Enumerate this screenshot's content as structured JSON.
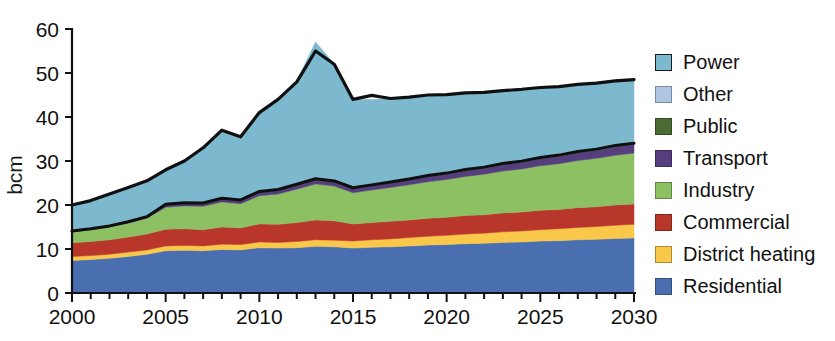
{
  "chart_data": {
    "type": "area",
    "stacked": true,
    "title": "",
    "subtitle": "",
    "xlabel": "",
    "ylabel": "bcm",
    "xlim": [
      2000,
      2030
    ],
    "ylim": [
      0,
      60
    ],
    "ytick_values": [
      0,
      10,
      20,
      30,
      40,
      50,
      60
    ],
    "ytick_labels": [
      "0",
      "10",
      "20",
      "30",
      "40",
      "50",
      "60"
    ],
    "xtick_values": [
      2000,
      2005,
      2010,
      2015,
      2020,
      2025,
      2030
    ],
    "xtick_labels": [
      "2000",
      "2005",
      "2010",
      "2015",
      "2020",
      "2025",
      "2030"
    ],
    "x_minor_tick_interval": 1,
    "grid": false,
    "legend_position": "right",
    "x": [
      2000,
      2001,
      2002,
      2003,
      2004,
      2005,
      2006,
      2007,
      2008,
      2009,
      2010,
      2011,
      2012,
      2013,
      2014,
      2015,
      2016,
      2017,
      2018,
      2019,
      2020,
      2021,
      2022,
      2023,
      2024,
      2025,
      2026,
      2027,
      2028,
      2029,
      2030
    ],
    "stack_order_bottom_to_top": [
      "Residential",
      "District heating",
      "Commercial",
      "Industry",
      "Transport",
      "Public",
      "Other",
      "Power"
    ],
    "series": [
      {
        "name": "Residential",
        "color": "#4A6FB0",
        "values": [
          7.4,
          7.6,
          7.9,
          8.3,
          8.8,
          9.6,
          9.7,
          9.6,
          9.9,
          9.8,
          10.3,
          10.2,
          10.3,
          10.6,
          10.5,
          10.2,
          10.4,
          10.5,
          10.7,
          10.9,
          11.0,
          11.2,
          11.3,
          11.5,
          11.6,
          11.8,
          11.9,
          12.1,
          12.2,
          12.4,
          12.5
        ]
      },
      {
        "name": "District heating",
        "color": "#F9C84A",
        "values": [
          0.9,
          0.9,
          0.9,
          1.0,
          1.0,
          1.1,
          1.1,
          1.1,
          1.2,
          1.2,
          1.3,
          1.3,
          1.4,
          1.5,
          1.5,
          1.6,
          1.7,
          1.8,
          1.9,
          2.0,
          2.1,
          2.2,
          2.3,
          2.4,
          2.5,
          2.6,
          2.7,
          2.8,
          2.9,
          3.0,
          3.1
        ]
      },
      {
        "name": "Commercial",
        "color": "#B8372A",
        "values": [
          3.1,
          3.2,
          3.3,
          3.4,
          3.6,
          3.8,
          3.8,
          3.7,
          3.9,
          3.8,
          4.1,
          4.1,
          4.3,
          4.5,
          4.4,
          3.9,
          3.9,
          4.0,
          4.0,
          4.1,
          4.1,
          4.2,
          4.2,
          4.3,
          4.3,
          4.4,
          4.4,
          4.5,
          4.5,
          4.6,
          4.6
        ]
      },
      {
        "name": "Industry",
        "color": "#8CC063",
        "values": [
          2.5,
          2.7,
          2.9,
          3.2,
          3.6,
          5.0,
          5.2,
          5.3,
          5.7,
          5.5,
          6.4,
          6.9,
          7.6,
          8.2,
          7.9,
          7.1,
          7.4,
          7.7,
          8.0,
          8.3,
          8.6,
          8.9,
          9.2,
          9.5,
          9.8,
          10.1,
          10.4,
          10.7,
          11.0,
          11.3,
          11.6
        ]
      },
      {
        "name": "Transport",
        "color": "#553E7E",
        "values": [
          0.1,
          0.1,
          0.15,
          0.2,
          0.25,
          0.5,
          0.55,
          0.6,
          0.7,
          0.7,
          0.8,
          0.85,
          0.9,
          0.95,
          0.95,
          0.9,
          0.95,
          1.0,
          1.1,
          1.15,
          1.2,
          1.3,
          1.35,
          1.45,
          1.5,
          1.6,
          1.65,
          1.75,
          1.8,
          1.9,
          1.95
        ]
      },
      {
        "name": "Public",
        "color": "#4A6B33",
        "values": [
          0.05,
          0.05,
          0.05,
          0.05,
          0.05,
          0.1,
          0.1,
          0.1,
          0.1,
          0.1,
          0.12,
          0.12,
          0.14,
          0.15,
          0.15,
          0.15,
          0.15,
          0.16,
          0.16,
          0.17,
          0.17,
          0.18,
          0.18,
          0.19,
          0.19,
          0.2,
          0.2,
          0.21,
          0.21,
          0.22,
          0.22
        ]
      },
      {
        "name": "Other",
        "color": "#AFC6E3",
        "values": [
          0.05,
          0.05,
          0.05,
          0.05,
          0.05,
          0.05,
          0.05,
          0.05,
          0.05,
          0.05,
          0.06,
          0.06,
          0.06,
          0.07,
          0.07,
          0.07,
          0.07,
          0.07,
          0.07,
          0.08,
          0.08,
          0.08,
          0.08,
          0.08,
          0.08,
          0.09,
          0.09,
          0.09,
          0.09,
          0.09,
          0.09
        ]
      },
      {
        "name": "Power",
        "color": "#7CB9CE",
        "values": [
          5.9,
          6.4,
          7.2,
          7.8,
          8.2,
          7.9,
          9.5,
          12.6,
          15.5,
          14.4,
          17.9,
          20.5,
          23.5,
          31.1,
          26.6,
          20.1,
          19.4,
          19.0,
          18.6,
          18.3,
          17.8,
          17.4,
          17.0,
          16.6,
          16.3,
          15.9,
          15.6,
          15.3,
          15.0,
          14.7,
          14.4
        ]
      }
    ],
    "totals": [
      20.0,
      21.0,
      22.5,
      24.0,
      25.5,
      28.0,
      30.0,
      33.0,
      37.0,
      35.5,
      41.0,
      44.0,
      48.0,
      55.0,
      52.0,
      44.0,
      44.9,
      44.2,
      44.5,
      45.0,
      45.1,
      45.5,
      45.6,
      46.0,
      46.3,
      46.7,
      46.9,
      47.4,
      47.7,
      48.2,
      48.5
    ]
  },
  "legend": {
    "items": [
      {
        "label": "Power",
        "color": "#7CB9CE",
        "outlined": true
      },
      {
        "label": "Other",
        "color": "#AFC6E3",
        "outlined": false
      },
      {
        "label": "Public",
        "color": "#4A6B33",
        "outlined": false
      },
      {
        "label": "Transport",
        "color": "#553E7E",
        "outlined": false
      },
      {
        "label": "Industry",
        "color": "#8CC063",
        "outlined": false
      },
      {
        "label": "Commercial",
        "color": "#B8372A",
        "outlined": false
      },
      {
        "label": "District heating",
        "color": "#F9C84A",
        "outlined": false
      },
      {
        "label": "Residential",
        "color": "#4A6FB0",
        "outlined": false
      }
    ]
  }
}
